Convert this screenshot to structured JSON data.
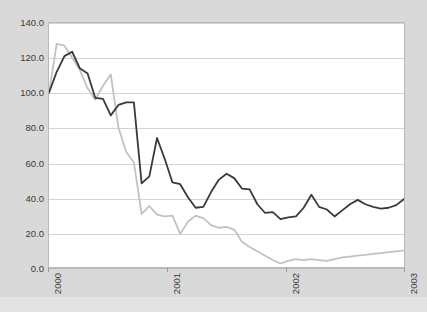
{
  "figure": {
    "background_color": "#d9d9d9",
    "plot_background_color": "#ffffff",
    "top_caption_text": ""
  },
  "chart_data": {
    "type": "line",
    "title": "",
    "subtitle": "",
    "xlabel": "",
    "ylabel": "",
    "ylim": [
      0.0,
      140.0
    ],
    "yticks": [
      0.0,
      20.0,
      40.0,
      60.0,
      80.0,
      100.0,
      120.0,
      140.0
    ],
    "ytick_labels": [
      "0.0",
      "20.0",
      "40.0",
      "60.0",
      "80.0",
      "100.0",
      "120.0",
      "140.0"
    ],
    "xlim": [
      0,
      36
    ],
    "xticks": [
      0,
      12,
      24,
      36
    ],
    "xtick_labels": [
      "2000",
      "2001",
      "2002",
      "2003"
    ],
    "xtick_rotation": -90,
    "grid": true,
    "grid_axis": "y",
    "legend": "none",
    "x": [
      0,
      1,
      2,
      3,
      4,
      5,
      6,
      7,
      8,
      9,
      10,
      11,
      12,
      13,
      14,
      15,
      16,
      17,
      18,
      19,
      20,
      21,
      22,
      23,
      24,
      25,
      26,
      27,
      28,
      29,
      30,
      31,
      32,
      33,
      34,
      35,
      36
    ],
    "series": [
      {
        "name": "series-dark",
        "color": "#3a3a3a",
        "line_width": 1.8,
        "values": [
          100.0,
          112.0,
          121.0,
          123.5,
          114.0,
          111.0,
          97.0,
          96.5,
          87.0,
          93.0,
          94.5,
          94.5,
          48.0,
          52.0,
          74.0,
          62.0,
          48.5,
          47.5,
          40.0,
          34.0,
          34.5,
          43.0,
          50.0,
          53.5,
          51.0,
          45.0,
          44.5,
          36.0,
          31.0,
          31.5,
          27.5,
          28.5,
          29.0,
          34.0,
          41.5,
          34.5,
          33.0
        ]
      },
      {
        "name": "series-light",
        "color": "#c2c2c2",
        "line_width": 1.8,
        "values": [
          100.0,
          128.0,
          127.0,
          120.0,
          113.0,
          102.5,
          96.0,
          104.0,
          110.5,
          80.0,
          66.0,
          60.0,
          30.5,
          35.0,
          30.0,
          29.0,
          29.5,
          19.0,
          26.0,
          29.5,
          28.0,
          24.0,
          22.5,
          23.0,
          21.5,
          14.5,
          11.5,
          9.0,
          6.5,
          4.0,
          2.0,
          3.5,
          4.5,
          4.0,
          4.5,
          4.0,
          3.5
        ]
      }
    ],
    "series_dark_tail": [
      29.0,
      32.5,
      36.0,
      38.5,
      36.0,
      34.5,
      33.5,
      34.0,
      35.5,
      39.0
    ],
    "series_light_tail": [
      4.5,
      5.5,
      6.0,
      6.5,
      7.0,
      7.5,
      8.0,
      8.5,
      9.0,
      9.5
    ]
  }
}
